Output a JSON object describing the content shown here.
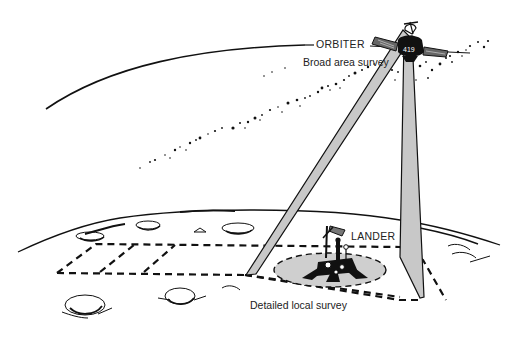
{
  "diagram": {
    "labels": {
      "orbiter": "ORBITER",
      "orbiter_caption": "Broad area survey",
      "lander": "LANDER",
      "lander_caption": "Detailed local survey"
    },
    "colors": {
      "ink": "#111111",
      "beam_fill": "#c8c8c8",
      "footprint_fill": "#cfcfcf",
      "background": "#ffffff"
    },
    "elements": [
      "orbit-arc",
      "orbiter-spacecraft",
      "left-survey-beam",
      "right-survey-beam",
      "star-field",
      "planet-horizon",
      "craters",
      "survey-grid",
      "lander-footprint",
      "lander-spacecraft"
    ]
  }
}
